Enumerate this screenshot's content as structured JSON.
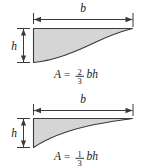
{
  "figure": {
    "background_color": "#ffffff",
    "fill_color": "#d5d5d5",
    "stroke_color": "#3a3a3a",
    "text_color": "#1a1a1a",
    "panels": [
      {
        "id": "upper",
        "shape_name": "parabolic-area-upper",
        "description": "Region under a concave-up curve filling two thirds of the bounding rectangle",
        "width_label": "b",
        "height_label": "h",
        "area": {
          "symbol": "A",
          "equals": "=",
          "numerator": "2",
          "denominator": "3",
          "terms": "bh",
          "full": "A = 2/3 bh"
        }
      },
      {
        "id": "lower",
        "shape_name": "parabolic-spandrel-lower",
        "description": "Spandrel region above a concave-up curve filling one third of the bounding rectangle",
        "width_label": "b",
        "height_label": "h",
        "area": {
          "symbol": "A",
          "equals": "=",
          "numerator": "1",
          "denominator": "3",
          "terms": "bh",
          "full": "A = 1/3 bh"
        }
      }
    ]
  }
}
